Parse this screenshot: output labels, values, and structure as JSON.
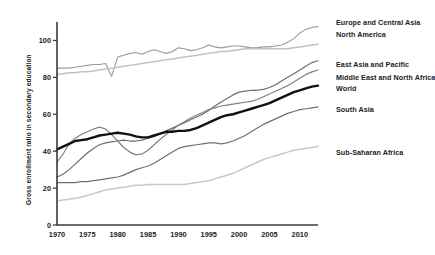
{
  "chart_data": {
    "type": "line",
    "title": "",
    "xlabel": "",
    "ylabel": "Gross enrollment ratio in secondary education",
    "xlim": [
      1970,
      2013
    ],
    "ylim": [
      0,
      110
    ],
    "grid": false,
    "legend_position": "right",
    "xticks": [
      1970,
      1975,
      1980,
      1985,
      1990,
      1995,
      2000,
      2005,
      2010
    ],
    "xtick_labels": [
      "1970",
      "1975",
      "1980",
      "1985",
      "1990",
      "1995",
      "2000",
      "2005",
      "2010"
    ],
    "yticks": [
      0,
      20,
      40,
      60,
      80,
      100
    ],
    "ytick_labels": [
      "0",
      "20",
      "40",
      "60",
      "80",
      "100"
    ],
    "x": [
      1970,
      1971,
      1972,
      1973,
      1974,
      1975,
      1976,
      1977,
      1978,
      1979,
      1980,
      1981,
      1982,
      1983,
      1984,
      1985,
      1986,
      1987,
      1988,
      1989,
      1990,
      1991,
      1992,
      1993,
      1994,
      1995,
      1996,
      1997,
      1998,
      1999,
      2000,
      2001,
      2002,
      2003,
      2004,
      2005,
      2006,
      2007,
      2008,
      2009,
      2010,
      2011,
      2012,
      2013
    ],
    "series": [
      {
        "name": "Europe and Central Asia",
        "color": "#9a9a9a",
        "width": 1.1,
        "values": [
          85,
          85,
          85,
          85.5,
          86,
          86.5,
          87,
          87,
          87.5,
          80.5,
          91,
          92,
          93,
          93.5,
          92.5,
          94,
          95,
          94,
          93,
          94,
          96,
          95.5,
          94.5,
          95,
          96,
          97.5,
          96.5,
          96,
          96.5,
          97,
          97,
          96.5,
          96,
          96,
          96.5,
          96.5,
          97,
          97.5,
          99,
          101,
          104,
          106,
          107,
          107.5
        ]
      },
      {
        "name": "North America",
        "color": "#c2c2c2",
        "width": 1.5,
        "values": [
          81.5,
          82,
          82.5,
          82.5,
          83,
          83,
          83.5,
          84,
          84.5,
          85,
          85.5,
          86,
          86.5,
          87,
          87.5,
          88,
          88.5,
          89,
          89.5,
          90,
          90.5,
          91,
          91.5,
          92,
          92.5,
          93,
          93.5,
          94,
          94,
          94.5,
          95,
          95.5,
          95.5,
          95.5,
          95.5,
          95.5,
          95.5,
          95.5,
          95.5,
          96,
          96.5,
          97,
          97.5,
          98
        ]
      },
      {
        "name": "East Asia and Pacific",
        "color": "#6e6e6e",
        "width": 1.2,
        "values": [
          26,
          27.5,
          30,
          33,
          36,
          39,
          41.5,
          43.5,
          44.5,
          45,
          45.5,
          46,
          45.5,
          45.5,
          46,
          47,
          48,
          49.5,
          51,
          52.5,
          54,
          55.5,
          57,
          58.5,
          60,
          62,
          64.5,
          66.5,
          68.5,
          70.5,
          72,
          72.5,
          73,
          73,
          73.5,
          74.5,
          76,
          78,
          80,
          82,
          84,
          86,
          88,
          89
        ]
      },
      {
        "name": "Middle East and North Africa",
        "color": "#808080",
        "width": 1.2,
        "values": [
          34,
          38.5,
          44,
          47,
          49,
          50.5,
          52,
          53,
          52,
          49,
          45.5,
          42,
          39.5,
          38,
          38.5,
          40.5,
          43.5,
          46.5,
          49,
          51.5,
          54,
          56,
          58,
          59.5,
          61,
          62.5,
          63.5,
          64.5,
          65,
          65.5,
          66,
          66.5,
          67,
          68,
          69.5,
          71,
          72.5,
          74,
          75.5,
          77.5,
          79.5,
          81.5,
          83,
          84
        ]
      },
      {
        "name": "World",
        "color": "#101010",
        "width": 2.4,
        "values": [
          41,
          42.5,
          44,
          45.5,
          46,
          46.5,
          47.5,
          48.5,
          49,
          49.5,
          50,
          49.5,
          49,
          48,
          47.5,
          47.5,
          48.5,
          49.5,
          50.5,
          50.5,
          51,
          51,
          51.5,
          52.5,
          54,
          55.5,
          57,
          58.5,
          59.5,
          60,
          61,
          62,
          63,
          64,
          65,
          66,
          67.5,
          69,
          70.5,
          72,
          73,
          74,
          75,
          75.5
        ]
      },
      {
        "name": "South Asia",
        "color": "#707070",
        "width": 1.2,
        "values": [
          23,
          23,
          23,
          23,
          23.5,
          23.5,
          24,
          24.5,
          25,
          25.5,
          26,
          27,
          28.5,
          30,
          31,
          32,
          33.5,
          35.5,
          37.5,
          39.5,
          41.5,
          42.5,
          43,
          43.5,
          44,
          44.5,
          44.5,
          44,
          44.5,
          45.5,
          47,
          48.5,
          50.5,
          52.5,
          54.5,
          56,
          57.5,
          59,
          60.5,
          61.5,
          62.5,
          63,
          63.5,
          64
        ]
      },
      {
        "name": "Sub-Saharan Africa",
        "color": "#c8c8c8",
        "width": 1.5,
        "values": [
          13,
          13.5,
          14,
          14.5,
          15,
          16,
          17,
          18,
          19,
          19.5,
          20,
          20.5,
          21,
          21.5,
          21.5,
          22,
          22,
          22,
          22,
          22,
          22,
          22,
          22.5,
          23,
          23.5,
          24,
          25,
          26,
          27,
          28,
          29.5,
          31,
          32.5,
          34,
          35.5,
          36.5,
          37.5,
          38.5,
          39.5,
          40.5,
          41,
          41.5,
          42,
          42.5
        ]
      }
    ],
    "legend_entries": [
      {
        "label": "Europe and Central Asia",
        "color": "#9a9a9a"
      },
      {
        "label": "North America",
        "color": "#c2c2c2"
      },
      {
        "label": "East Asia and Pacific",
        "color": "#6e6e6e"
      },
      {
        "label": "Middle East and North Africa",
        "color": "#808080"
      },
      {
        "label": "World",
        "color": "#101010"
      },
      {
        "label": "South Asia",
        "color": "#707070"
      },
      {
        "label": "Sub-Saharan Africa",
        "color": "#c8c8c8"
      }
    ]
  },
  "legend_labels": {
    "europe_central_asia": "Europe and Central Asia",
    "north_america": "North America",
    "east_asia_pacific": "East Asia and Pacific",
    "middle_east_north_africa": "Middle East and North Africa",
    "world": "World",
    "south_asia": "South Asia",
    "sub_saharan_africa": "Sub-Saharan Africa"
  },
  "axes": {
    "y_axis_title": "Gross enrollment ratio in secondary education"
  }
}
